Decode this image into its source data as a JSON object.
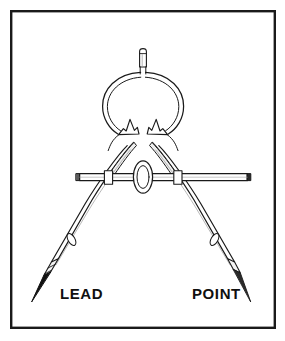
{
  "figure": {
    "background_color": "#ffffff",
    "ink_color": "#1a1a1a",
    "frame": {
      "name": "border-frame",
      "x": 10,
      "y": 10,
      "width": 266,
      "height": 319,
      "stroke_color": "#1a1a1a",
      "stroke_width": 2.4,
      "fill": "none"
    },
    "labels": [
      {
        "id": "lead",
        "text": "LEAD",
        "x": 60,
        "y": 298,
        "anchor": "start",
        "points_to": "lead-leg-tip"
      },
      {
        "id": "point",
        "text": "POINT",
        "x": 192,
        "y": 298,
        "anchor": "start",
        "points_to": "point-leg-tip"
      }
    ],
    "parts": [
      {
        "id": "top-knob",
        "name": "top-knob",
        "description": "small cylindrical knob at top of spring ring",
        "cx": 143,
        "top_y": 48,
        "bottom_y": 67,
        "half_width": 3.6
      },
      {
        "id": "spring-ring",
        "name": "spring-ring",
        "description": "large circular spring bow loop",
        "cx": 143,
        "cy": 101,
        "outer_rx": 41,
        "outer_ry": 37,
        "inner_rx": 36,
        "inner_ry": 32
      },
      {
        "id": "fork-left",
        "name": "fork-arrowhead-left",
        "description": "left arrowhead / notch above pivot"
      },
      {
        "id": "fork-right",
        "name": "fork-arrowhead-right",
        "description": "right arrowhead / notch above pivot"
      },
      {
        "id": "pivot",
        "name": "pivot-hinge",
        "description": "hinge circle joining the two legs",
        "cx": 143,
        "cy": 141,
        "r": 7.5
      },
      {
        "id": "crossbar",
        "name": "cross-bar",
        "description": "horizontal adjusting bar with rounded end caps",
        "x1": 76,
        "x2": 251,
        "y": 177,
        "thickness": 7
      },
      {
        "id": "thumb-nut",
        "name": "thumb-nut",
        "description": "knurled oval adjusting nut at centre of cross bar",
        "cx": 143,
        "cy": 177,
        "outer_rx": 9.5,
        "outer_ry": 16,
        "inner_rx": 6,
        "inner_ry": 11
      },
      {
        "id": "lead-leg",
        "name": "lead-leg",
        "description": "left leg terminating in sharpened graphite lead",
        "top_x": 128,
        "top_y": 144,
        "tip_x": 38,
        "tip_y": 300
      },
      {
        "id": "point-leg",
        "name": "point-leg",
        "description": "right leg terminating in a steel needle point",
        "top_x": 158,
        "top_y": 144,
        "tip_x": 248,
        "tip_y": 300
      },
      {
        "id": "lead-slot",
        "name": "lead-leg-slot",
        "description": "small oval slot detail on left leg"
      },
      {
        "id": "point-slot",
        "name": "point-leg-slot",
        "description": "small oval slot detail on right leg"
      },
      {
        "id": "lead-ferrule",
        "name": "lead-ferrule",
        "description": "banded sleeve gripping the lead"
      },
      {
        "id": "lead-tip",
        "name": "lead-tip",
        "description": "solid black sharpened graphite tip",
        "fill": "#111111"
      },
      {
        "id": "point-tip",
        "name": "needle-point-tip",
        "description": "fine steel needle tip",
        "fill": "#111111"
      }
    ]
  }
}
